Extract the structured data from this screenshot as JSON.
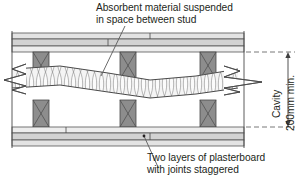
{
  "diagram": {
    "annotations": {
      "top_note_line1": "Absorbent material suspended",
      "top_note_line2": "in space between stud",
      "bottom_note_line1": "Two layers of plasterboard",
      "bottom_note_line2": "with joints staggered",
      "cavity_label": "Cavity",
      "cavity_dimension": "200mm min."
    },
    "parts": {
      "plasterboard_layer": "plasterboard-layer",
      "stud": "timber-stud",
      "absorbent_quilt": "absorbent-quilt",
      "board_joint": "staggered-board-joint",
      "break_line": "break-line",
      "dimension_line": "cavity-dimension-line",
      "extension_line": "dimension-extension-line",
      "leader_line": "annotation-leader-line"
    },
    "colors": {
      "outline": "#3b3b3b",
      "board_fill": "#d9d9d9",
      "board_fill_light": "#ececec",
      "stud_fill": "#8d8d8d",
      "quilt_fill": "#f2f2f2",
      "dim_line": "#4a4a4a",
      "text": "#231f20",
      "background": "#ffffff"
    },
    "geometry": {
      "wall_left": 12,
      "wall_right": 244,
      "cavity_top": 52,
      "cavity_bottom": 127,
      "stud_positions": [
        40,
        128,
        208
      ],
      "top_board_y": 33,
      "bottom_board_y": 128
    }
  }
}
